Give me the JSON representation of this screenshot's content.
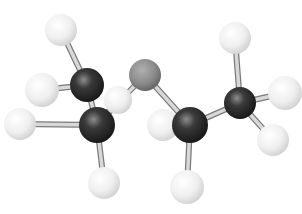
{
  "image": {
    "subject": "ball-and-stick molecular model",
    "background": "#ffffff"
  },
  "colors": {
    "hydrogen": "#f2f2f2",
    "carbon": "#2a2a2a",
    "heteroatom": "#8a8a8a",
    "bond": "#d8d8d8"
  },
  "atoms": [
    {
      "id": "h1",
      "element": "H",
      "x": 61,
      "y": 30,
      "r": 16
    },
    {
      "id": "h2",
      "element": "H",
      "x": 42,
      "y": 90,
      "r": 17
    },
    {
      "id": "h3",
      "element": "H",
      "x": 20,
      "y": 124,
      "r": 16
    },
    {
      "id": "h4",
      "element": "H",
      "x": 118,
      "y": 100,
      "r": 14
    },
    {
      "id": "h5",
      "element": "H",
      "x": 163,
      "y": 125,
      "r": 16
    },
    {
      "id": "h6",
      "element": "H",
      "x": 235,
      "y": 38,
      "r": 16
    },
    {
      "id": "h7",
      "element": "H",
      "x": 285,
      "y": 93,
      "r": 17
    },
    {
      "id": "h8",
      "element": "H",
      "x": 273,
      "y": 140,
      "r": 16
    },
    {
      "id": "h9",
      "element": "H",
      "x": 104,
      "y": 183,
      "r": 16
    },
    {
      "id": "h10",
      "element": "H",
      "x": 187,
      "y": 187,
      "r": 17
    },
    {
      "id": "c1",
      "element": "C",
      "x": 87,
      "y": 85,
      "r": 17
    },
    {
      "id": "c2",
      "element": "C",
      "x": 97,
      "y": 125,
      "r": 18
    },
    {
      "id": "x1",
      "element": "X",
      "x": 145,
      "y": 75,
      "r": 16
    },
    {
      "id": "c3",
      "element": "C",
      "x": 190,
      "y": 125,
      "r": 18
    },
    {
      "id": "c4",
      "element": "C",
      "x": 240,
      "y": 103,
      "r": 16
    }
  ],
  "bonds": [
    [
      "h1",
      "c1"
    ],
    [
      "h2",
      "c1"
    ],
    [
      "h3",
      "c2"
    ],
    [
      "c1",
      "c2"
    ],
    [
      "c2",
      "h4"
    ],
    [
      "c2",
      "x1"
    ],
    [
      "c2",
      "h9"
    ],
    [
      "x1",
      "c3"
    ],
    [
      "c3",
      "h5"
    ],
    [
      "c3",
      "c4"
    ],
    [
      "c3",
      "h10"
    ],
    [
      "c4",
      "h6"
    ],
    [
      "c4",
      "h7"
    ],
    [
      "c4",
      "h8"
    ]
  ]
}
